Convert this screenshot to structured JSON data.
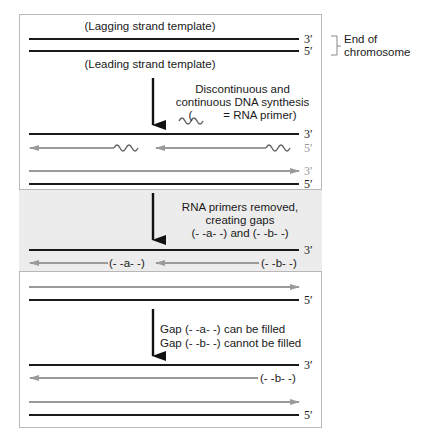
{
  "figure": {
    "stage1": {
      "top_label": "(Lagging strand template)",
      "bottom_label": "(Leading strand template)",
      "end_top": "3′",
      "end_bottom": "5′",
      "bracket_label_line1": "End of",
      "bracket_label_line2": "chromosome"
    },
    "step1": {
      "line1": "Discontinuous and",
      "line2": "continuous DNA synthesis",
      "line3_prefix": "(",
      "line3_suffix": "= RNA primer)"
    },
    "stage2": {
      "ends": [
        "3′",
        "5′",
        "3′",
        "5′"
      ]
    },
    "step2": {
      "line1": "RNA primers removed,",
      "line2": "creating gaps",
      "line3": "(- -a- -) and (- -b- -)"
    },
    "stage3": {
      "end_top": "3′",
      "gap_a": "(- -a- -)",
      "gap_b": "(- -b- -)",
      "end_bottom": "5′"
    },
    "step3": {
      "line1": "Gap (- -a- -) can be filled",
      "line2": "Gap (- -b- -) cannot be filled"
    },
    "stage4": {
      "end_top": "3′",
      "gap_b": "(- -b- -)",
      "end_bottom": "5′"
    },
    "colors": {
      "template_strand": "#1a1a1a",
      "new_strand": "#9a9a9a",
      "shaded_panel": "#ececec"
    }
  }
}
